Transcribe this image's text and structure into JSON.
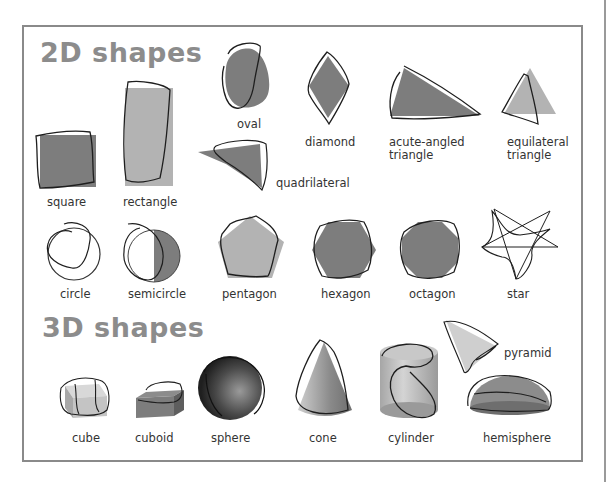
{
  "sections": {
    "two_d": {
      "title": "2D shapes",
      "shapes": [
        {
          "name": "oval"
        },
        {
          "name": "diamond"
        },
        {
          "name": "acute-angled",
          "name2": "triangle"
        },
        {
          "name": "equilateral",
          "name2": "triangle"
        },
        {
          "name": "square"
        },
        {
          "name": "rectangle"
        },
        {
          "name": "quadrilateral"
        },
        {
          "name": "circle"
        },
        {
          "name": "semicircle"
        },
        {
          "name": "pentagon"
        },
        {
          "name": "hexagon"
        },
        {
          "name": "octagon"
        },
        {
          "name": "star"
        }
      ]
    },
    "three_d": {
      "title": "3D shapes",
      "shapes": [
        {
          "name": "cube"
        },
        {
          "name": "cuboid"
        },
        {
          "name": "sphere"
        },
        {
          "name": "cone"
        },
        {
          "name": "cylinder"
        },
        {
          "name": "pyramid"
        },
        {
          "name": "hemisphere"
        }
      ]
    }
  },
  "colors": {
    "heading": "#8c8c8c",
    "shape_dark": "#7d7d7d",
    "shape_light": "#b3b3b3",
    "pen": "#1e1e1e",
    "frame": "#8a8a8a"
  }
}
